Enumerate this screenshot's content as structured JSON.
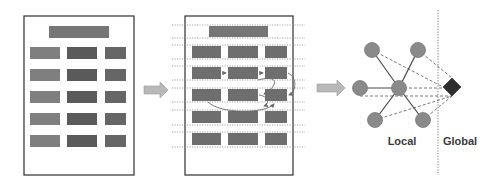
{
  "diagram": {
    "colors": {
      "box_stroke": "#2f2f2f",
      "cell_light": "#7f7f7f",
      "cell_dark": "#5a5a5a",
      "cell_mid": "#666666",
      "header_bar": "#767676",
      "arrow_fill": "#b8b8b8",
      "arrow_stroke": "#9a9a9a",
      "node_fill": "#8a8a8a",
      "node_stroke": "#7a7a7a",
      "global_node_fill": "#2e2e2e",
      "edge_solid": "#4a4a4a",
      "edge_dashed": "#555555",
      "relation_curve": "#6a6a6a",
      "divider": "#777777"
    },
    "panels": [
      {
        "id": "document",
        "rows": 5,
        "columns": 3,
        "has_header": true
      },
      {
        "id": "grid",
        "rows": 5,
        "columns": 3,
        "has_header": true,
        "dotted_row_guides": true,
        "relation_arrows": true
      },
      {
        "id": "graph",
        "center_node": "hub",
        "neighbor_count": 5,
        "global_node": "diamond"
      }
    ],
    "labels": {
      "local": "Local",
      "global": "Global"
    }
  }
}
